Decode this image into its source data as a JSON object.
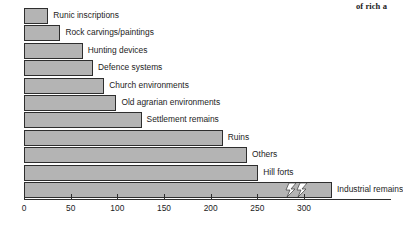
{
  "caption": {
    "fragment": "of rich a"
  },
  "chart_data": {
    "type": "bar",
    "orientation": "horizontal",
    "title": "",
    "xlabel": "",
    "ylabel": "",
    "xlim": [
      0,
      330
    ],
    "grid": false,
    "legend": false,
    "bar_color": "#b4b4b4",
    "bar_edge_color": "#2e2e2e",
    "axis_break": {
      "present": true,
      "on_category": "Industrial remains",
      "note": "bar is truncated with a zigzag break; true value exceeds axis range"
    },
    "ticks": [
      {
        "value": 0,
        "label": "0"
      },
      {
        "value": 50,
        "label": "50"
      },
      {
        "value": 100,
        "label": "100"
      },
      {
        "value": 150,
        "label": "150"
      },
      {
        "value": 200,
        "label": "200"
      },
      {
        "value": 250,
        "label": "250"
      },
      {
        "value": 300,
        "label": "300"
      }
    ],
    "categories": [
      "Runic inscriptions",
      "Rock carvings/paintings",
      "Hunting devices",
      "Defence systems",
      "Church environments",
      "Old agrarian environments",
      "Settlement remains",
      "Ruins",
      "Others",
      "Hill forts",
      "Industrial remains"
    ],
    "values": [
      26,
      39,
      63,
      74,
      86,
      99,
      126,
      213,
      239,
      251,
      330
    ]
  }
}
